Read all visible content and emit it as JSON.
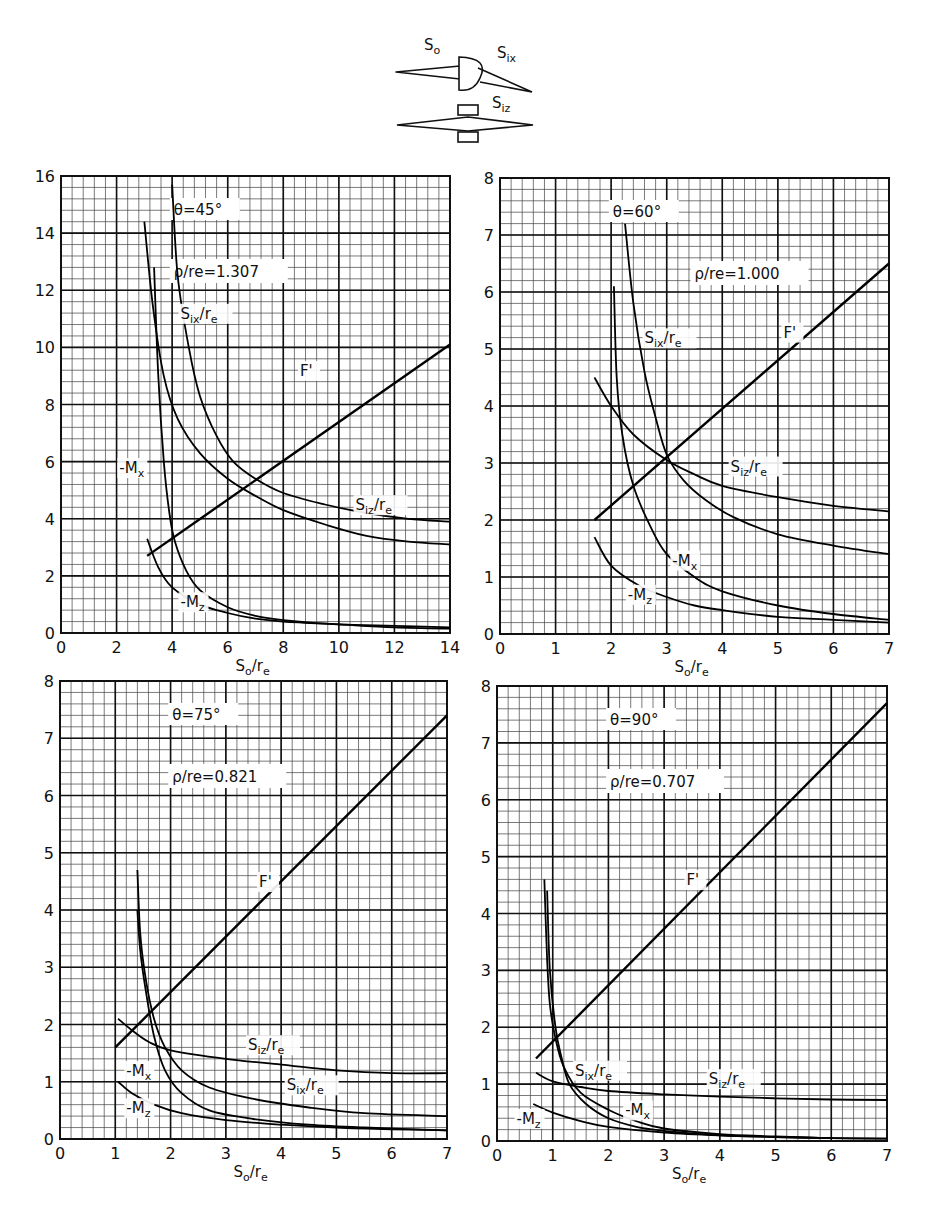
{
  "figure": {
    "schematic": {
      "labels": [
        "S₀",
        "Sᵢₓ",
        "Sᵢz"
      ],
      "label_so": "So",
      "label_six": "Six",
      "label_siz": "Siz"
    }
  },
  "chart_data": [
    {
      "type": "line",
      "id": "theta45",
      "title": "θ=45°",
      "annotation": "ρ/re=1.307",
      "xlabel": "So/re",
      "ylabel": "",
      "xlim": [
        0,
        14
      ],
      "ylim": [
        0,
        16
      ],
      "xticks": [
        0,
        2,
        4,
        6,
        8,
        10,
        12,
        14
      ],
      "yticks": [
        0,
        2,
        4,
        6,
        8,
        10,
        12,
        14,
        16
      ],
      "grid": true,
      "minor_x": 35,
      "minor_y": 40,
      "px": {
        "x0": 61,
        "y0": 633,
        "x1": 450,
        "y1": 176
      },
      "series": [
        {
          "name": "F'",
          "label_at": [
            8.6,
            9.0
          ],
          "points": [
            [
              3.1,
              2.7
            ],
            [
              14,
              10.1
            ]
          ]
        },
        {
          "name": "Siz/re",
          "label_at": [
            10.6,
            4.3
          ],
          "points": [
            [
              4.0,
              15.7
            ],
            [
              4.2,
              12.5
            ],
            [
              4.6,
              10.0
            ],
            [
              5.0,
              8.3
            ],
            [
              5.6,
              6.9
            ],
            [
              6.2,
              6.0
            ],
            [
              7.0,
              5.4
            ],
            [
              8.0,
              4.9
            ],
            [
              9.5,
              4.5
            ],
            [
              11,
              4.2
            ],
            [
              12.5,
              4.0
            ],
            [
              14,
              3.9
            ]
          ]
        },
        {
          "name": "Six/re",
          "label_at": [
            4.3,
            11.0
          ],
          "points": [
            [
              3.0,
              14.4
            ],
            [
              3.3,
              11.5
            ],
            [
              3.7,
              9.0
            ],
            [
              4.2,
              7.5
            ],
            [
              5.0,
              6.3
            ],
            [
              6.0,
              5.4
            ],
            [
              7.0,
              4.8
            ],
            [
              8.0,
              4.3
            ],
            [
              9.5,
              3.8
            ],
            [
              11,
              3.4
            ],
            [
              12.5,
              3.2
            ],
            [
              14,
              3.1
            ]
          ]
        },
        {
          "name": "-Mx",
          "label_at": [
            2.1,
            5.6
          ],
          "points": [
            [
              3.35,
              12.8
            ],
            [
              3.5,
              9.0
            ],
            [
              3.7,
              6.0
            ],
            [
              3.9,
              4.2
            ],
            [
              4.1,
              3.2
            ],
            [
              4.5,
              2.2
            ],
            [
              5.0,
              1.5
            ],
            [
              6.0,
              0.9
            ],
            [
              7.0,
              0.6
            ],
            [
              8.0,
              0.45
            ],
            [
              10,
              0.3
            ],
            [
              12,
              0.25
            ],
            [
              14,
              0.2
            ]
          ]
        },
        {
          "name": "-Mz",
          "label_at": [
            4.3,
            0.9
          ],
          "points": [
            [
              3.1,
              3.3
            ],
            [
              3.5,
              2.3
            ],
            [
              4.0,
              1.6
            ],
            [
              5.0,
              1.0
            ],
            [
              6.0,
              0.7
            ],
            [
              7.0,
              0.5
            ],
            [
              8.0,
              0.4
            ],
            [
              10,
              0.3
            ],
            [
              12,
              0.2
            ],
            [
              14,
              0.15
            ]
          ]
        }
      ]
    },
    {
      "type": "line",
      "id": "theta60",
      "title": "θ=60°",
      "annotation": "ρ/re=1.000",
      "xlabel": "So/re",
      "ylabel": "",
      "xlim": [
        0,
        7
      ],
      "ylim": [
        0,
        8
      ],
      "xticks": [
        0,
        1,
        2,
        3,
        4,
        5,
        6,
        7
      ],
      "yticks": [
        0,
        1,
        2,
        3,
        4,
        5,
        6,
        7,
        8
      ],
      "grid": true,
      "minor_x": 35,
      "minor_y": 40,
      "px": {
        "x0": 500,
        "y0": 634,
        "x1": 889,
        "y1": 178
      },
      "series": [
        {
          "name": "F'",
          "label_at": [
            5.1,
            5.2
          ],
          "points": [
            [
              1.7,
              2.0
            ],
            [
              7.0,
              6.5
            ]
          ]
        },
        {
          "name": "Siz/re",
          "label_at": [
            4.15,
            2.85
          ],
          "points": [
            [
              1.7,
              4.5
            ],
            [
              2.0,
              4.0
            ],
            [
              2.4,
              3.5
            ],
            [
              3.0,
              3.05
            ],
            [
              3.5,
              2.8
            ],
            [
              4.0,
              2.6
            ],
            [
              5.0,
              2.4
            ],
            [
              6.0,
              2.25
            ],
            [
              7.0,
              2.15
            ]
          ]
        },
        {
          "name": "Six/re",
          "label_at": [
            2.6,
            5.1
          ],
          "points": [
            [
              2.25,
              7.2
            ],
            [
              2.4,
              5.8
            ],
            [
              2.6,
              4.6
            ],
            [
              2.8,
              3.8
            ],
            [
              3.0,
              3.15
            ],
            [
              3.3,
              2.7
            ],
            [
              3.7,
              2.35
            ],
            [
              4.2,
              2.05
            ],
            [
              5.0,
              1.75
            ],
            [
              6.0,
              1.55
            ],
            [
              7.0,
              1.4
            ]
          ]
        },
        {
          "name": "-Mx",
          "label_at": [
            3.1,
            1.2
          ],
          "points": [
            [
              2.05,
              6.1
            ],
            [
              2.1,
              4.5
            ],
            [
              2.2,
              3.5
            ],
            [
              2.4,
              2.6
            ],
            [
              2.7,
              1.9
            ],
            [
              3.0,
              1.4
            ],
            [
              3.5,
              1.0
            ],
            [
              4.0,
              0.75
            ],
            [
              5.0,
              0.5
            ],
            [
              6.0,
              0.35
            ],
            [
              7.0,
              0.25
            ]
          ]
        },
        {
          "name": "-Mz",
          "label_at": [
            2.3,
            0.6
          ],
          "points": [
            [
              1.7,
              1.7
            ],
            [
              2.0,
              1.2
            ],
            [
              2.5,
              0.85
            ],
            [
              3.0,
              0.65
            ],
            [
              3.5,
              0.5
            ],
            [
              4.0,
              0.42
            ],
            [
              5.0,
              0.3
            ],
            [
              6.0,
              0.25
            ],
            [
              7.0,
              0.2
            ]
          ]
        }
      ]
    },
    {
      "type": "line",
      "id": "theta75",
      "title": "θ=75°",
      "annotation": "ρ/re=0.821",
      "xlabel": "So/re",
      "ylabel": "",
      "xlim": [
        0,
        7
      ],
      "ylim": [
        0,
        8
      ],
      "xticks": [
        0,
        1,
        2,
        3,
        4,
        5,
        6,
        7
      ],
      "yticks": [
        0,
        1,
        2,
        3,
        4,
        5,
        6,
        7,
        8
      ],
      "grid": true,
      "minor_x": 35,
      "minor_y": 40,
      "px": {
        "x0": 60,
        "y0": 1139,
        "x1": 447,
        "y1": 681
      },
      "series": [
        {
          "name": "F'",
          "label_at": [
            3.6,
            4.4
          ],
          "points": [
            [
              1.0,
              1.6
            ],
            [
              7.0,
              7.4
            ]
          ]
        },
        {
          "name": "Siz/re",
          "label_at": [
            3.4,
            1.55
          ],
          "points": [
            [
              1.05,
              2.1
            ],
            [
              1.3,
              1.9
            ],
            [
              1.6,
              1.7
            ],
            [
              2.0,
              1.55
            ],
            [
              3.0,
              1.4
            ],
            [
              4.0,
              1.3
            ],
            [
              5.0,
              1.2
            ],
            [
              6.0,
              1.15
            ],
            [
              7.0,
              1.15
            ]
          ]
        },
        {
          "name": "Six/re",
          "label_at": [
            4.1,
            0.85
          ],
          "points": [
            [
              1.4,
              4.7
            ],
            [
              1.45,
              3.6
            ],
            [
              1.55,
              2.8
            ],
            [
              1.7,
              2.1
            ],
            [
              1.9,
              1.6
            ],
            [
              2.2,
              1.2
            ],
            [
              2.7,
              0.9
            ],
            [
              3.5,
              0.7
            ],
            [
              4.5,
              0.55
            ],
            [
              5.5,
              0.45
            ],
            [
              7.0,
              0.4
            ]
          ]
        },
        {
          "name": "-Mx",
          "label_at": [
            1.2,
            1.1
          ],
          "points": [
            [
              1.4,
              4.0
            ],
            [
              1.45,
              3.3
            ],
            [
              1.55,
              2.6
            ],
            [
              1.7,
              1.8
            ],
            [
              1.9,
              1.2
            ],
            [
              2.2,
              0.8
            ],
            [
              2.7,
              0.5
            ],
            [
              3.5,
              0.35
            ],
            [
              4.5,
              0.25
            ],
            [
              5.5,
              0.2
            ],
            [
              7.0,
              0.15
            ]
          ]
        },
        {
          "name": "-Mz",
          "label_at": [
            1.2,
            0.45
          ],
          "points": [
            [
              1.05,
              1.0
            ],
            [
              1.3,
              0.8
            ],
            [
              1.7,
              0.6
            ],
            [
              2.2,
              0.45
            ],
            [
              3.0,
              0.33
            ],
            [
              4.0,
              0.25
            ],
            [
              5.0,
              0.2
            ],
            [
              6.0,
              0.17
            ],
            [
              7.0,
              0.15
            ]
          ]
        }
      ]
    },
    {
      "type": "line",
      "id": "theta90",
      "title": "θ=90°",
      "annotation": "ρ/re=0.707",
      "xlabel": "So/re",
      "ylabel": "",
      "xlim": [
        0,
        7
      ],
      "ylim": [
        0,
        8
      ],
      "xticks": [
        0,
        1,
        2,
        3,
        4,
        5,
        6,
        7
      ],
      "yticks": [
        0,
        1,
        2,
        3,
        4,
        5,
        6,
        7,
        8
      ],
      "grid": true,
      "minor_x": 35,
      "minor_y": 40,
      "px": {
        "x0": 497,
        "y0": 1141,
        "x1": 887,
        "y1": 686
      },
      "series": [
        {
          "name": "F'",
          "label_at": [
            3.4,
            4.5
          ],
          "points": [
            [
              0.7,
              1.45
            ],
            [
              7.0,
              7.7
            ]
          ]
        },
        {
          "name": "Siz/re",
          "label_at": [
            3.8,
            1.0
          ],
          "points": [
            [
              0.7,
              1.2
            ],
            [
              1.0,
              1.05
            ],
            [
              1.5,
              0.95
            ],
            [
              2.0,
              0.88
            ],
            [
              3.0,
              0.82
            ],
            [
              4.0,
              0.78
            ],
            [
              5.0,
              0.75
            ],
            [
              6.0,
              0.73
            ],
            [
              7.0,
              0.72
            ]
          ]
        },
        {
          "name": "Six/re",
          "label_at": [
            1.4,
            1.15
          ],
          "points": [
            [
              0.85,
              4.6
            ],
            [
              0.9,
              3.2
            ],
            [
              0.95,
              2.4
            ],
            [
              1.05,
              1.8
            ],
            [
              1.2,
              1.3
            ],
            [
              1.5,
              0.85
            ],
            [
              2.0,
              0.55
            ],
            [
              2.5,
              0.35
            ],
            [
              3.0,
              0.22
            ],
            [
              4.0,
              0.12
            ],
            [
              5.0,
              0.08
            ],
            [
              6.0,
              0.05
            ],
            [
              7.0,
              0.04
            ]
          ]
        },
        {
          "name": "-Mx",
          "label_at": [
            2.3,
            0.45
          ],
          "points": [
            [
              0.9,
              4.4
            ],
            [
              0.95,
              3.0
            ],
            [
              1.05,
              2.0
            ],
            [
              1.15,
              1.5
            ],
            [
              1.3,
              1.0
            ],
            [
              1.6,
              0.65
            ],
            [
              2.0,
              0.4
            ],
            [
              2.5,
              0.25
            ],
            [
              3.0,
              0.18
            ],
            [
              4.0,
              0.1
            ],
            [
              5.0,
              0.07
            ],
            [
              6.0,
              0.05
            ]
          ]
        },
        {
          "name": "-Mz",
          "label_at": [
            0.35,
            0.3
          ],
          "points": [
            [
              0.65,
              0.65
            ],
            [
              1.0,
              0.5
            ],
            [
              1.5,
              0.35
            ],
            [
              2.0,
              0.25
            ],
            [
              3.0,
              0.15
            ],
            [
              4.0,
              0.1
            ],
            [
              5.0,
              0.07
            ],
            [
              6.0,
              0.05
            ],
            [
              7.0,
              0.04
            ]
          ]
        }
      ]
    }
  ]
}
